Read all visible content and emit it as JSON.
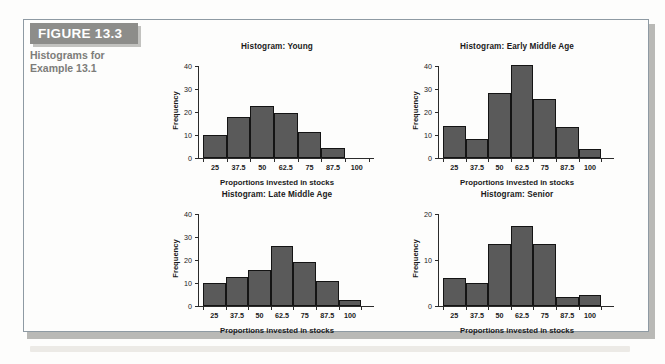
{
  "figure": {
    "banner_label": "FIGURE 13.3",
    "caption_line1": "Histograms for",
    "caption_line2": "Example 13.1"
  },
  "colors": {
    "bar_fill": "#5a5a5a",
    "bar_stroke": "#141414",
    "banner_bg": "#8d8d8a",
    "banner_text": "#ffffff",
    "caption_text": "#7c7c79",
    "frame_border": "#8e9aa3",
    "page_bg": "#fdfdfc"
  },
  "chart_data": [
    {
      "type": "bar",
      "id": "young",
      "title": "Histogram: Young",
      "xlabel": "Proportions invested in stocks",
      "ylabel": "Frequency",
      "categories": [
        "25",
        "37.5",
        "50",
        "62.5",
        "75",
        "87.5",
        "100"
      ],
      "bin_edges": [
        18.75,
        31.25,
        43.75,
        56.25,
        68.75,
        81.25,
        93.75
      ],
      "values": [
        10,
        18,
        22.5,
        19.5,
        11.5,
        4.5
      ],
      "ylim": [
        0,
        40
      ],
      "yticks": [
        0,
        10,
        20,
        30,
        40
      ],
      "xlim": [
        16,
        106
      ],
      "grid": false,
      "legend": "none"
    },
    {
      "type": "bar",
      "id": "early-middle-age",
      "title": "Histogram: Early Middle Age",
      "xlabel": "Proportions invested in stocks",
      "ylabel": "Frequency",
      "categories": [
        "25",
        "37.5",
        "50",
        "62.5",
        "75",
        "87.5",
        "100"
      ],
      "bin_edges": [
        18.75,
        31.25,
        43.75,
        56.25,
        68.75,
        81.25,
        93.75,
        106.25
      ],
      "values": [
        14,
        8.5,
        28.5,
        40.5,
        25.5,
        13.5,
        4
      ],
      "ylim": [
        0,
        40
      ],
      "yticks": [
        0,
        10,
        20,
        30,
        40
      ],
      "xlim": [
        16,
        110
      ],
      "grid": false,
      "legend": "none"
    },
    {
      "type": "bar",
      "id": "late-middle-age",
      "title": "Histogram: Late Middle Age",
      "xlabel": "Proportions invested in stocks",
      "ylabel": "Frequency",
      "categories": [
        "25",
        "37.5",
        "50",
        "62.5",
        "75",
        "87.5",
        "100"
      ],
      "bin_edges": [
        18.75,
        31.25,
        43.75,
        56.25,
        68.75,
        81.25,
        93.75,
        106.25
      ],
      "values": [
        10,
        12.5,
        15.5,
        26,
        19,
        11,
        2.5
      ],
      "ylim": [
        0,
        40
      ],
      "yticks": [
        0,
        10,
        20,
        30,
        40
      ],
      "xlim": [
        16,
        110
      ],
      "grid": false,
      "legend": "none"
    },
    {
      "type": "bar",
      "id": "senior",
      "title": "Histogram: Senior",
      "xlabel": "Proportions invested in stocks",
      "ylabel": "Frequency",
      "categories": [
        "25",
        "37.5",
        "50",
        "62.5",
        "75",
        "87.5",
        "100"
      ],
      "bin_edges": [
        18.75,
        31.25,
        43.75,
        56.25,
        68.75,
        81.25,
        93.75,
        106.25
      ],
      "values": [
        6,
        5,
        13.5,
        17.5,
        13.5,
        2,
        2.3
      ],
      "ylim": [
        0,
        20
      ],
      "yticks": [
        0,
        10,
        20
      ],
      "xlim": [
        16,
        110
      ],
      "grid": false,
      "legend": "none"
    }
  ]
}
